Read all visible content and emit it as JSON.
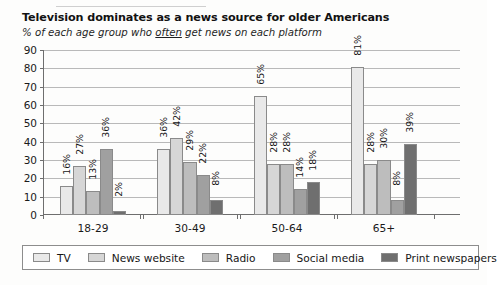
{
  "title": "Television dominates as a news source for older Americans",
  "subtitle_before": "% of each age group who ",
  "subtitle_emphasis": "often",
  "subtitle_after": " get news on each platform",
  "chart_data": {
    "type": "bar",
    "title": "Television dominates as a news source for older Americans",
    "subtitle": "% of each age group who often get news on each platform",
    "xlabel": "",
    "ylabel": "",
    "ylim": [
      0,
      90
    ],
    "yticks": [
      0,
      10,
      20,
      30,
      40,
      50,
      60,
      70,
      80,
      90
    ],
    "grid": true,
    "legend_position": "bottom",
    "value_suffix": "%",
    "categories": [
      "18-29",
      "30-49",
      "50-64",
      "65+"
    ],
    "series": [
      {
        "name": "TV",
        "color": "#e9e9e9",
        "values": [
          16,
          36,
          65,
          81
        ],
        "labels": [
          "16%",
          "36%",
          "65%",
          "81%"
        ]
      },
      {
        "name": "News website",
        "color": "#d6d6d6",
        "values": [
          27,
          42,
          28,
          28
        ],
        "labels": [
          "27%",
          "42%",
          "28%",
          "28%"
        ]
      },
      {
        "name": "Radio",
        "color": "#bdbdbd",
        "values": [
          13,
          29,
          28,
          30
        ],
        "labels": [
          "13%",
          "29%",
          "28%",
          "30%"
        ]
      },
      {
        "name": "Social media",
        "color": "#a0a0a0",
        "values": [
          36,
          22,
          14,
          8
        ],
        "labels": [
          "36%",
          "22%",
          "14%",
          "8%"
        ]
      },
      {
        "name": "Print newspapers",
        "color": "#6f6f6f",
        "values": [
          2,
          8,
          18,
          39
        ],
        "labels": [
          "2%",
          "8%",
          "18%",
          "39%"
        ]
      }
    ]
  }
}
